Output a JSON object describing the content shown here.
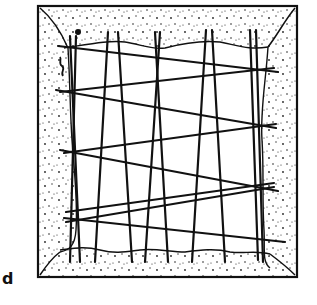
{
  "figure": {
    "panel_label": "d",
    "colors": {
      "ink": "#111111",
      "paper": "#ffffff"
    },
    "frame": {
      "x": 38,
      "y": 6,
      "w": 259,
      "h": 271
    },
    "inner_boundary": {
      "top": "M64,48 C90,44 110,40 125,42 C140,44 150,50 165,48 C180,44 200,40 220,42 C240,46 250,50 268,47",
      "right": "M268,47 C266,80 260,110 262,140 C264,170 262,200 264,230 C265,250 262,262 270,268",
      "bottom": "M60,250 C75,248 85,246 100,250 C115,254 125,252 140,250 C155,248 170,252 185,252 C200,250 215,248 230,252 C245,254 255,250 270,254",
      "left": "M68,48 C70,80 70,110 72,140 C74,170 78,200 76,230 C75,245 70,250 60,252"
    },
    "corner_curves": [
      "M40,8 C52,18 62,34 68,48",
      "M295,8 C285,20 278,34 268,47",
      "M40,275 C46,266 52,258 60,252",
      "M295,275 C288,268 278,260 270,254"
    ],
    "warp_lines": [
      {
        "x1": 70,
        "y1": 36,
        "x2": 80,
        "y2": 262
      },
      {
        "x1": 76,
        "y1": 36,
        "x2": 70,
        "y2": 262
      },
      {
        "x1": 108,
        "y1": 32,
        "x2": 95,
        "y2": 262
      },
      {
        "x1": 118,
        "y1": 32,
        "x2": 132,
        "y2": 262
      },
      {
        "x1": 155,
        "y1": 32,
        "x2": 168,
        "y2": 262
      },
      {
        "x1": 160,
        "y1": 32,
        "x2": 145,
        "y2": 262
      },
      {
        "x1": 206,
        "y1": 30,
        "x2": 192,
        "y2": 262
      },
      {
        "x1": 212,
        "y1": 30,
        "x2": 225,
        "y2": 262
      },
      {
        "x1": 250,
        "y1": 30,
        "x2": 258,
        "y2": 260
      },
      {
        "x1": 256,
        "y1": 30,
        "x2": 263,
        "y2": 262
      }
    ],
    "weft_lines": [
      {
        "x1": 58,
        "y1": 46,
        "x2": 278,
        "y2": 72
      },
      {
        "x1": 60,
        "y1": 92,
        "x2": 274,
        "y2": 68
      },
      {
        "x1": 56,
        "y1": 90,
        "x2": 276,
        "y2": 128
      },
      {
        "x1": 64,
        "y1": 153,
        "x2": 276,
        "y2": 124
      },
      {
        "x1": 60,
        "y1": 150,
        "x2": 278,
        "y2": 191
      },
      {
        "x1": 66,
        "y1": 212,
        "x2": 274,
        "y2": 183
      },
      {
        "x1": 64,
        "y1": 218,
        "x2": 285,
        "y2": 242
      },
      {
        "x1": 66,
        "y1": 222,
        "x2": 274,
        "y2": 187
      }
    ],
    "markers": [
      {
        "type": "dot",
        "cx": 78,
        "cy": 32,
        "r": 3
      }
    ],
    "squiggle": "M60,57 C62,60 58,63 62,66 C66,69 60,72 63,76"
  }
}
